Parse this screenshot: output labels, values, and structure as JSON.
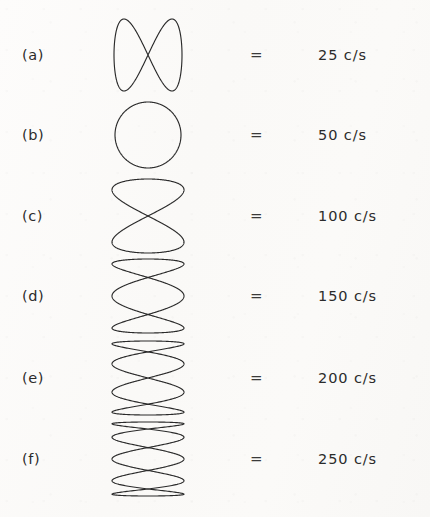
{
  "figure": {
    "background_color": "#fbfaf8",
    "ink_color": "#2a2a2a",
    "equals_symbol": "=",
    "rows": [
      {
        "label": "(a)",
        "value": "25 c/s",
        "pattern": "horizontal-figure-eight",
        "lobes": 2,
        "orientation": "horizontal",
        "frequency_hz": 25,
        "unit": "c/s"
      },
      {
        "label": "(b)",
        "value": "50 c/s",
        "pattern": "circle",
        "lobes": 1,
        "orientation": "none",
        "frequency_hz": 50,
        "unit": "c/s"
      },
      {
        "label": "(c)",
        "value": "100 c/s",
        "pattern": "vertical-lobes",
        "lobes": 2,
        "orientation": "vertical",
        "frequency_hz": 100,
        "unit": "c/s"
      },
      {
        "label": "(d)",
        "value": "150 c/s",
        "pattern": "vertical-lobes",
        "lobes": 3,
        "orientation": "vertical",
        "frequency_hz": 150,
        "unit": "c/s"
      },
      {
        "label": "(e)",
        "value": "200 c/s",
        "pattern": "vertical-lobes",
        "lobes": 4,
        "orientation": "vertical",
        "frequency_hz": 200,
        "unit": "c/s"
      },
      {
        "label": "(f)",
        "value": "250 c/s",
        "pattern": "vertical-lobes",
        "lobes": 5,
        "orientation": "vertical",
        "frequency_hz": 250,
        "unit": "c/s"
      }
    ]
  }
}
